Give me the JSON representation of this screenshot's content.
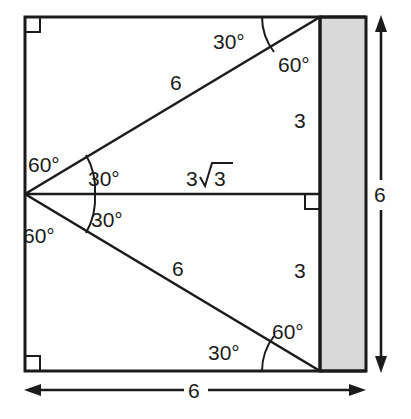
{
  "figure": {
    "colors": {
      "stroke": "#1b1b1b",
      "shaded_fill": "#d9d9d9",
      "background": "#ffffff"
    },
    "square": {
      "side_label": "6"
    },
    "shaded_band": {
      "fill": "#d9d9d9"
    },
    "labels": {
      "top_angle_30": "30°",
      "top_angle_60": "60°",
      "upper_hypotenuse_6": "6",
      "upper_right_side_3": "3",
      "apex_upper_60": "60°",
      "apex_upper_30": "30°",
      "apex_lower_30": "30°",
      "apex_lower_60": "60°",
      "middle_base": "3√3",
      "middle_base_coef": "3",
      "middle_base_radicand": "3",
      "lower_hypotenuse_6": "6",
      "lower_right_side_3": "3",
      "bottom_angle_30": "30°",
      "bottom_angle_60": "60°",
      "right_dimension_6": "6",
      "bottom_dimension_6": "6"
    }
  }
}
